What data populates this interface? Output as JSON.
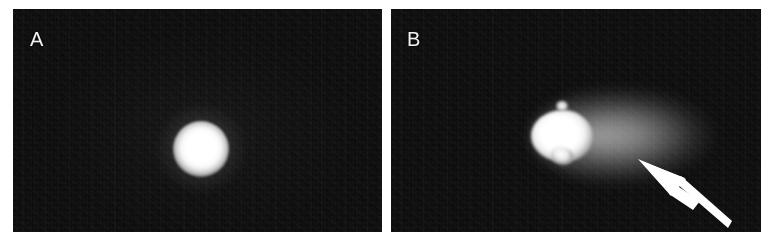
{
  "figure": {
    "kind": "two-panel-grayscale-micrograph",
    "background_color": "#ffffff",
    "width": 775,
    "height": 251,
    "panel_background_color": "#070707",
    "annotation_color": "#ffffff"
  },
  "panels": [
    {
      "id": "A",
      "label": "A",
      "label_color": "#f2f2f2",
      "bounds": {
        "x": 13,
        "y": 9,
        "width": 369,
        "height": 223
      },
      "features": [
        {
          "name": "bright-spot",
          "description": "single round saturated bright signal",
          "center": {
            "x": 188,
            "y": 140
          },
          "radius": 28,
          "peak_color": "#ffffff"
        }
      ]
    },
    {
      "id": "B",
      "label": "B",
      "label_color": "#f2f2f2",
      "bounds": {
        "x": 391,
        "y": 9,
        "width": 370,
        "height": 223
      },
      "features": [
        {
          "name": "bright-core",
          "description": "saturated bright signal with irregular lower spur",
          "center": {
            "x": 562,
            "y": 127
          },
          "radius": 31,
          "peak_color": "#ffffff"
        },
        {
          "name": "diffuse-plume",
          "description": "diffuse comet-like halo extending to the right of the core",
          "center": {
            "x": 640,
            "y": 127
          },
          "width": 215,
          "height": 98,
          "peak_color": "#b4b4b4"
        },
        {
          "name": "arrow-annotation",
          "description": "solid white arrow pointing up-left toward the diffuse plume",
          "tip": {
            "x": 650,
            "y": 158
          },
          "tail": {
            "x": 733,
            "y": 223
          },
          "color": "#ffffff"
        }
      ]
    }
  ]
}
